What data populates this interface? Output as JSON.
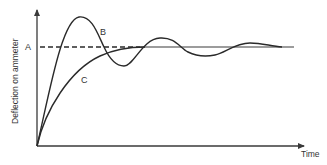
{
  "diagram": {
    "y_axis_label": "Deflection on ammeter",
    "x_axis_label": "Time",
    "steady_level_label": "A",
    "curves": [
      {
        "id": "B",
        "label": "B",
        "description": "underdamped oscillating response"
      },
      {
        "id": "C",
        "label": "C",
        "description": "critically damped/overdamped smooth rise"
      }
    ],
    "colors": {
      "line": "#2a2a2a",
      "text": "#333333",
      "background": "#ffffff"
    }
  }
}
